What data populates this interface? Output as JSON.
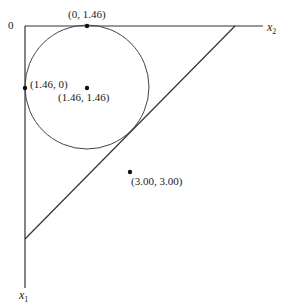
{
  "diagram": {
    "origin_label": "0",
    "x_axis_label": "x",
    "x_axis_subscript": "2",
    "y_axis_label": "x",
    "y_axis_subscript": "1",
    "points": [
      {
        "label": "(0, 1.46)"
      },
      {
        "label": "(1.46, 0)"
      },
      {
        "label": "(1.46, 1.46)"
      },
      {
        "label": "(3.00, 3.00)"
      }
    ],
    "colors": {
      "stroke": "#333333",
      "text": "#222222",
      "background": "#ffffff"
    }
  },
  "caption": ""
}
